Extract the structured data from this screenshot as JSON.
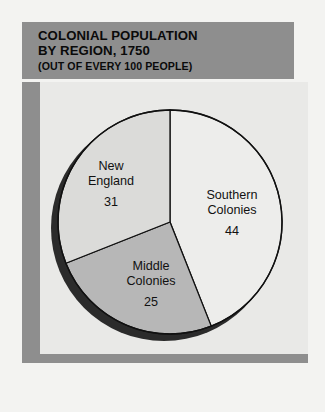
{
  "header": {
    "title_line1": "COLONIAL POPULATION",
    "title_line2": "BY REGION, 1750",
    "subtitle": "(OUT OF EVERY 100 PEOPLE)",
    "background_color": "#8e8e8e",
    "text_color": "#0a0a0a"
  },
  "panel": {
    "frame_color": "#8e8e8e",
    "background_color": "#e9e9e7"
  },
  "labels": {
    "new_england": {
      "name_line1": "New",
      "name_line2": "England",
      "value": "31"
    },
    "southern": {
      "name_line1": "Southern",
      "name_line2": "Colonies",
      "value": "44"
    },
    "middle": {
      "name_line1": "Middle",
      "name_line2": "Colonies",
      "value": "25"
    }
  },
  "chart_data": {
    "type": "pie",
    "title": "COLONIAL POPULATION BY REGION, 1750",
    "subtitle": "(OUT OF EVERY 100 PEOPLE)",
    "unit": "people out of every 100",
    "categories": [
      "Southern Colonies",
      "New England",
      "Middle Colonies"
    ],
    "values": [
      44,
      31,
      25
    ],
    "total": 100,
    "start_angle_deg": 0,
    "direction": "clockwise",
    "legend": "none",
    "grid": false,
    "slices": [
      {
        "label": "Southern Colonies",
        "value": 44,
        "percent": 44,
        "color": "#ededeb",
        "start_deg": 0,
        "end_deg": 158.4
      },
      {
        "label": "Middle Colonies",
        "value": 25,
        "percent": 25,
        "color": "#b7b7b7",
        "start_deg": 158.4,
        "end_deg": 248.4
      },
      {
        "label": "New England",
        "value": 31,
        "percent": 31,
        "color": "#dbdbd9",
        "start_deg": 248.4,
        "end_deg": 360
      }
    ],
    "shadow_color": "#2b2b2b",
    "outline_color": "#111111"
  }
}
